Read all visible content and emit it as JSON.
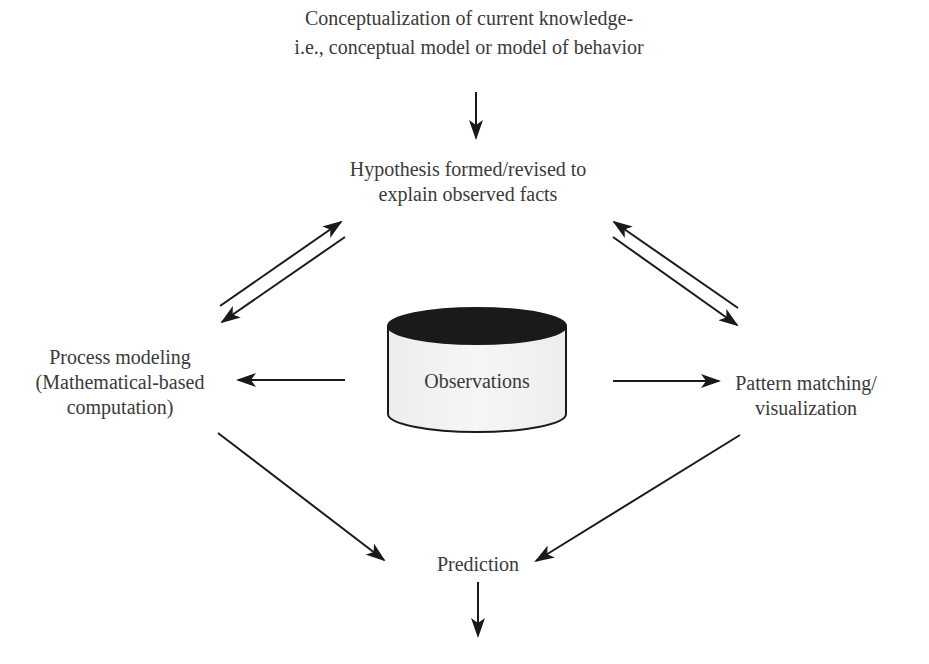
{
  "diagram": {
    "nodes": {
      "conceptualization": {
        "line1": "Conceptualization of current knowledge-",
        "line2": "i.e., conceptual model or model of behavior"
      },
      "hypothesis": {
        "line1": "Hypothesis formed/revised to",
        "line2": "explain observed facts"
      },
      "process_modeling": {
        "line1": "Process modeling",
        "line2": "(Mathematical-based",
        "line3": "computation)"
      },
      "observations": {
        "label": "Observations",
        "shape": "cylinder",
        "top_color": "#1a1a1a",
        "body_color": "#f2f2f2"
      },
      "pattern_matching": {
        "line1": "Pattern matching/",
        "line2": "visualization"
      },
      "prediction": {
        "label": "Prediction"
      }
    },
    "edges": [
      {
        "from": "conceptualization",
        "to": "hypothesis"
      },
      {
        "from": "process_modeling",
        "to": "hypothesis"
      },
      {
        "from": "hypothesis",
        "to": "process_modeling"
      },
      {
        "from": "hypothesis",
        "to": "pattern_matching"
      },
      {
        "from": "pattern_matching",
        "to": "hypothesis"
      },
      {
        "from": "observations",
        "to": "process_modeling"
      },
      {
        "from": "observations",
        "to": "pattern_matching"
      },
      {
        "from": "process_modeling",
        "to": "prediction"
      },
      {
        "from": "pattern_matching",
        "to": "prediction"
      },
      {
        "from": "prediction",
        "to": "output"
      }
    ],
    "colors": {
      "text": "#3a3a3a",
      "arrow": "#1a1a1a",
      "background": "#ffffff"
    }
  }
}
